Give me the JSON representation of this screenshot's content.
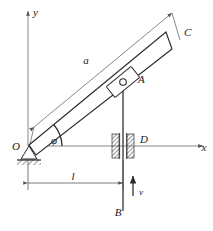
{
  "figure": {
    "type": "mechanism-kinematics-diagram",
    "background_color": "#ffffff",
    "line_color": "#2b2b2b",
    "thin_line_color": "#6b6b6b"
  },
  "axes": {
    "x_label": "x",
    "y_label": "y",
    "origin_label": "O"
  },
  "points": {
    "C": "C",
    "A": "A",
    "D": "D",
    "B": "B"
  },
  "dimensions": {
    "bar_length_label": "a",
    "horizontal_distance_label": "l"
  },
  "angles": {
    "phi": "φ"
  },
  "vectors": {
    "velocity_label": "v"
  },
  "components": {
    "pin_support": "pin-support-at-O",
    "slider_block": "slider-block-at-A",
    "guide_left": "fixed-guide-left",
    "guide_right": "fixed-guide-right",
    "vertical_rod": "rod-AB",
    "inclined_bar": "bar-OC"
  }
}
